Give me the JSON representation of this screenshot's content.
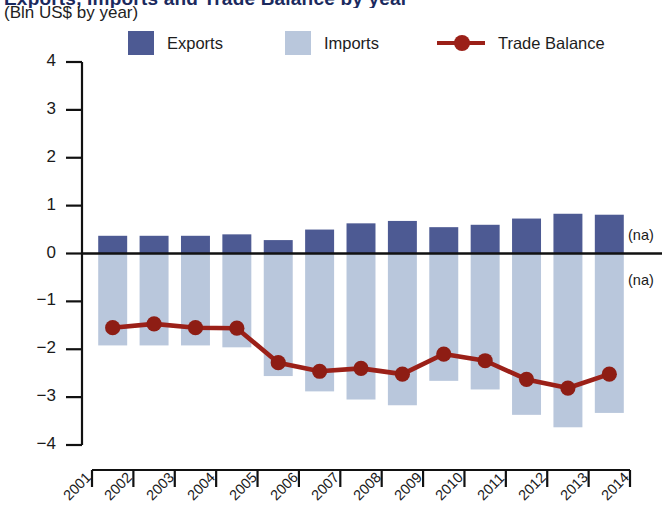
{
  "header": {
    "title": "Exports, Imports and Trade Balance by year",
    "subtitle": "(Bln US$ by year)"
  },
  "legend": {
    "position": "top",
    "items": [
      {
        "label": "Exports",
        "type": "swatch",
        "color": "#4d5a93",
        "icon": "square-swatch-icon"
      },
      {
        "label": "Imports",
        "type": "swatch",
        "color": "#b9c7dc",
        "icon": "square-swatch-icon"
      },
      {
        "label": "Trade Balance",
        "type": "line-marker",
        "color": "#9b2018",
        "icon": "line-marker-icon"
      }
    ]
  },
  "annotations": [
    {
      "name": "na-exports",
      "text": "(na)",
      "x": 2014,
      "y": 0.35
    },
    {
      "name": "na-imports",
      "text": "(na)",
      "x": 2014,
      "y": -0.6
    }
  ],
  "axes": {
    "y": {
      "min": -4,
      "max": 4,
      "ticks": [
        4,
        3,
        2,
        1,
        0,
        -1,
        -2,
        -3,
        -4
      ],
      "tick_labels": [
        "4",
        "3",
        "2",
        "1",
        "0",
        "−1",
        "−2",
        "−3",
        "−4"
      ],
      "label": ""
    },
    "x": {
      "ticks": [
        2001,
        2002,
        2003,
        2004,
        2005,
        2006,
        2007,
        2008,
        2009,
        2010,
        2011,
        2012,
        2013,
        2014
      ],
      "tick_labels": [
        "2001",
        "2002",
        "2003",
        "2004",
        "2005",
        "2006",
        "2007",
        "2008",
        "2009",
        "2010",
        "2011",
        "2012",
        "2013",
        "2014"
      ],
      "label": ""
    },
    "grid": false
  },
  "chart_data": {
    "type": "bar",
    "title": "Exports, Imports and Trade Balance by year",
    "subtitle": "(Bln US$ by year)",
    "xlabel": "",
    "ylabel": "Bln US$",
    "ylim": [
      -4,
      4
    ],
    "categories": [
      "2001",
      "2002",
      "2003",
      "2004",
      "2005",
      "2006",
      "2007",
      "2008",
      "2009",
      "2010",
      "2011",
      "2012",
      "2013"
    ],
    "series": [
      {
        "name": "Exports",
        "type": "bar",
        "color": "#4d5a93",
        "values": [
          0.37,
          0.37,
          0.37,
          0.4,
          0.28,
          0.5,
          0.63,
          0.68,
          0.55,
          0.6,
          0.73,
          0.83,
          0.81
        ]
      },
      {
        "name": "Imports",
        "type": "bar",
        "color": "#b9c7dc",
        "values": [
          -1.92,
          -1.92,
          -1.92,
          -1.96,
          -2.56,
          -2.88,
          -3.05,
          -3.17,
          -2.66,
          -2.84,
          -3.37,
          -3.63,
          -3.33
        ]
      },
      {
        "name": "Trade Balance",
        "type": "line",
        "color": "#9b2018",
        "values": [
          -1.55,
          -1.47,
          -1.55,
          -1.56,
          -2.28,
          -2.46,
          -2.4,
          -2.52,
          -2.1,
          -2.24,
          -2.63,
          -2.81,
          -2.52
        ]
      }
    ]
  }
}
